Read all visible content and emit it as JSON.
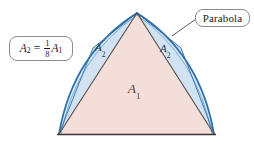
{
  "figure": {
    "callout": {
      "label": "Parabola"
    },
    "formula": {
      "lhs": "A",
      "lhs_sub": "2",
      "equals": "=",
      "numerator": "1",
      "denominator": "8",
      "rhs": "A",
      "rhs_sub": "1",
      "plain": "A2 = (1/8)A1"
    },
    "regions": [
      {
        "name": "large-triangle",
        "label": "A",
        "sub": "1",
        "fill": "#f3ded9",
        "stroke": "#5a4a45"
      },
      {
        "name": "small-triangle-left",
        "label": "A",
        "sub": "2",
        "fill": "#d9e8f5",
        "stroke": "#2f6fa8"
      },
      {
        "name": "small-triangle-right",
        "label": "A",
        "sub": "2",
        "fill": "#d9e8f5",
        "stroke": "#2f6fa8"
      }
    ],
    "colors": {
      "parabola_curve": "#2f6fa8",
      "parabola_curve_light": "#6fa6d2",
      "triangle_fill": "#f3ded9",
      "segment_fill": "#d9e8f5",
      "triangle_stroke": "#5a4a45",
      "base_line": "#3d3330",
      "callout_border": "#8c8c8c",
      "background": "#ffffff"
    },
    "geometry": {
      "apex": [
        137,
        13
      ],
      "base_left": [
        59,
        134
      ],
      "base_right": [
        214,
        134
      ],
      "leader_from": [
        172,
        36
      ],
      "leader_to": [
        196,
        19
      ]
    }
  }
}
